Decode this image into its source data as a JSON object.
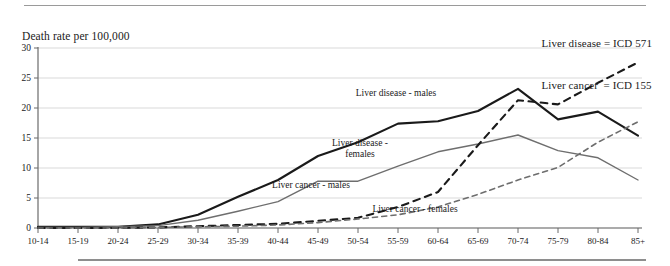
{
  "figure": {
    "axis_title": "Death rate per 100,000",
    "legend_lines": [
      "Liver disease = ICD 571",
      "Liver cancer  = ICD 155"
    ]
  },
  "chart_data": {
    "type": "line",
    "title": "",
    "subtitle": "",
    "xlabel": "",
    "ylabel": "Death rate per 100,000",
    "grid": true,
    "legend_position": "inline-annotations",
    "ylim": [
      0,
      30
    ],
    "yticks": [
      0,
      5,
      10,
      15,
      20,
      25,
      30
    ],
    "categories": [
      "10-14",
      "15-19",
      "20-24",
      "25-29",
      "30-34",
      "35-39",
      "40-44",
      "45-49",
      "50-54",
      "55-59",
      "60-64",
      "65-69",
      "70-74",
      "75-79",
      "80-84",
      "85+"
    ],
    "series": [
      {
        "name": "Liver disease - males",
        "style": "solid",
        "color": "#1a1a1a",
        "width": 2.1,
        "values": [
          0.2,
          0.2,
          0.2,
          0.6,
          2.2,
          5.2,
          8.0,
          12.0,
          14.3,
          17.4,
          17.8,
          19.5,
          23.2,
          18.1,
          19.4,
          15.4
        ],
        "label": "Liver disease - males",
        "label_lines": [
          "Liver disease - males"
        ],
        "label_x": 396,
        "label_y": 96
      },
      {
        "name": "Liver disease - females",
        "style": "solid",
        "color": "#6e6e6e",
        "width": 1.4,
        "values": [
          0.1,
          0.1,
          0.2,
          0.4,
          1.3,
          2.8,
          4.4,
          7.8,
          7.8,
          10.3,
          12.7,
          14.0,
          15.5,
          12.9,
          11.7,
          8.0
        ],
        "label": "Liver disease - females",
        "label_lines": [
          "Liver disease -",
          "females"
        ],
        "label_x": 360,
        "label_y": 146
      },
      {
        "name": "Liver cancer - males",
        "style": "dashed",
        "color": "#1a1a1a",
        "width": 2.1,
        "values": [
          0.0,
          0.0,
          0.0,
          0.1,
          0.3,
          0.5,
          0.7,
          1.2,
          1.7,
          3.5,
          6.0,
          13.8,
          21.3,
          20.6,
          24.2,
          27.6
        ],
        "label": "Liver cancer - males",
        "label_lines": [
          "Liver cancer - males"
        ],
        "label_x": 311,
        "label_y": 188
      },
      {
        "name": "Liver cancer - females",
        "style": "dashed",
        "color": "#6e6e6e",
        "width": 1.6,
        "values": [
          0.0,
          0.0,
          0.0,
          0.1,
          0.2,
          0.3,
          0.5,
          0.9,
          1.5,
          2.2,
          3.5,
          5.6,
          8.0,
          10.1,
          14.3,
          17.7
        ],
        "label": "Liver cancer - females",
        "label_lines": [
          "Liver cancer - females"
        ],
        "label_x": 415,
        "label_y": 212
      }
    ]
  }
}
